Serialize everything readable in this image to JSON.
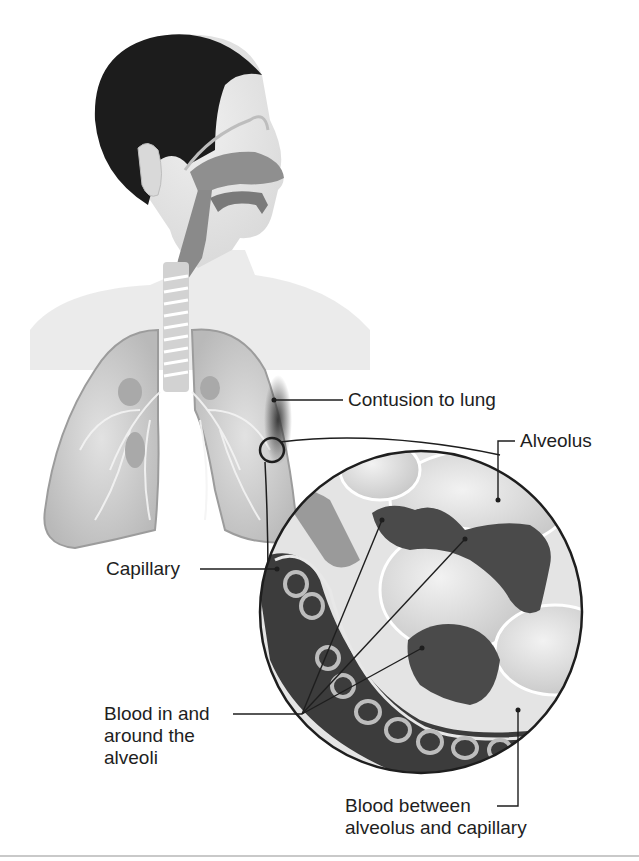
{
  "figure": {
    "colors": {
      "background": "#ffffff",
      "hair": "#1c1c1c",
      "skin": "#e6e6e6",
      "airway": "#8a8a8a",
      "lung": "#d4d4d4",
      "blood": "#4a4a4a",
      "leader_line": "#1e1e1e",
      "divider": "#c9c9c9"
    },
    "labels": {
      "contusion": "Contusion to lung",
      "alveolus": "Alveolus",
      "capillary": "Capillary",
      "blood_in_line1": "Blood in and",
      "blood_in_line2": "around the",
      "blood_in_line3": "alveoli",
      "blood_between_line1": "Blood between",
      "blood_between_line2": "alveolus and capillary"
    }
  }
}
